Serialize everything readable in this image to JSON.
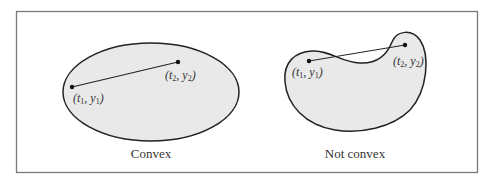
{
  "figure": {
    "frame_color": "#7a7a7a",
    "fill_color": "#e9e9e9",
    "stroke_color": "#222222",
    "convex": {
      "caption": "Convex",
      "point1": {
        "label_t": "t",
        "label_y": "y",
        "sub": "1",
        "text": "(t1, y1)"
      },
      "point2": {
        "label_t": "t",
        "label_y": "y",
        "sub": "2",
        "text": "(t2, y2)"
      }
    },
    "not_convex": {
      "caption": "Not convex",
      "point1": {
        "label_t": "t",
        "label_y": "y",
        "sub": "1",
        "text": "(t1, y1)"
      },
      "point2": {
        "label_t": "t",
        "label_y": "y",
        "sub": "2",
        "text": "(t2, y2)"
      }
    }
  }
}
